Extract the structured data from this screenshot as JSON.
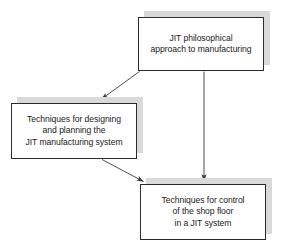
{
  "diagram": {
    "type": "flowchart",
    "background_color": "#ffffff",
    "box_border_color": "#2b2b2b",
    "box_fill_color": "#ffffff",
    "shadow_color": "#d9d9d9",
    "arrow_color": "#3a3a3a",
    "nodes": [
      {
        "id": "philosophy",
        "label": "JIT philosophical\napproach to manufacturing",
        "position": "top-right"
      },
      {
        "id": "design",
        "label": "Techniques for designing\nand planning the\nJIT manufacturing system",
        "position": "middle-left"
      },
      {
        "id": "control",
        "label": "Techniques for control\nof the shop floor\nin a JIT system",
        "position": "bottom-right"
      }
    ],
    "edges": [
      {
        "id": "philosophy-to-design",
        "from": "philosophy",
        "to": "design",
        "style": "solid-arrow",
        "direction": "down-left"
      },
      {
        "id": "philosophy-to-control",
        "from": "philosophy",
        "to": "control",
        "style": "solid-arrow",
        "direction": "down"
      },
      {
        "id": "design-to-control",
        "from": "design",
        "to": "control",
        "style": "solid-arrow",
        "direction": "down-right"
      }
    ]
  }
}
